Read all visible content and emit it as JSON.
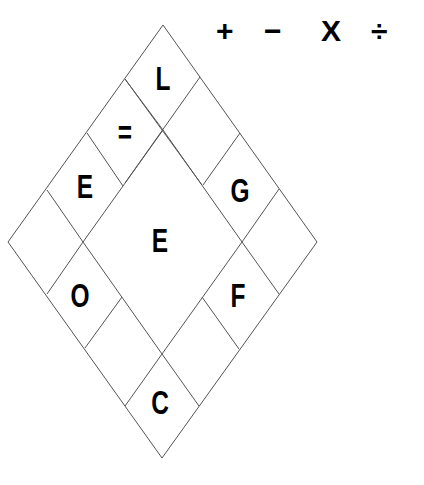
{
  "operators": [
    "+",
    "−",
    "X",
    "÷"
  ],
  "puzzle": {
    "cells": [
      {
        "id": "top",
        "label": "L"
      },
      {
        "id": "upper-left-1",
        "label": "="
      },
      {
        "id": "upper-left-2",
        "label": "E"
      },
      {
        "id": "left-corner",
        "label": ""
      },
      {
        "id": "lower-left-1",
        "label": "O"
      },
      {
        "id": "lower-left-2",
        "label": ""
      },
      {
        "id": "bottom",
        "label": "C"
      },
      {
        "id": "lower-right-2",
        "label": ""
      },
      {
        "id": "lower-right-1",
        "label": "F"
      },
      {
        "id": "right-corner",
        "label": ""
      },
      {
        "id": "upper-right-2",
        "label": "G"
      },
      {
        "id": "upper-right-1",
        "label": ""
      },
      {
        "id": "center",
        "label": "E"
      }
    ]
  },
  "colors": {
    "line": "#555555",
    "text": "#000000",
    "background": "#ffffff"
  }
}
